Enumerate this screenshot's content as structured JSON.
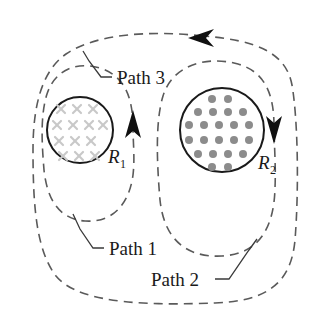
{
  "figure": {
    "background_color": "#ffffff",
    "width": 319,
    "height": 316
  },
  "colors": {
    "path_stroke": "#5a5a5a",
    "circle_stroke": "#1a1a1a",
    "cross_fill": "#c8c8c8",
    "dot_fill": "#8c8c8c",
    "text": "#1a1a1a",
    "arrow_fill": "#101010",
    "leader_stroke": "#3a3a3a"
  },
  "regions": [
    {
      "id": "R1",
      "label": "R",
      "subscript": "1",
      "marker_type": "cross",
      "marker_meaning": "field-into-page",
      "center_x": 80,
      "center_y": 130,
      "radius": 33,
      "label_x": 108,
      "label_y": 160,
      "marker_color": "#c8c8c8",
      "marker_rows": 4,
      "marker_cols": 4
    },
    {
      "id": "R2",
      "label": "R",
      "subscript": "2",
      "marker_type": "dot",
      "marker_meaning": "field-out-of-page",
      "center_x": 222,
      "center_y": 130,
      "radius": 42,
      "label_x": 258,
      "label_y": 166,
      "marker_color": "#8c8c8c",
      "marker_rows": 6,
      "marker_cols": 6,
      "marker_radius": 4
    }
  ],
  "paths": [
    {
      "id": "path1",
      "label": "Path 1",
      "encloses": [
        "R1"
      ],
      "style": "dashed",
      "label_x": 110,
      "label_y": 253,
      "leader": "M 103 248 L 92 248 L 80 230 L 72 212",
      "arrow": {
        "direction": "up",
        "x": 133,
        "y": 128,
        "points": "133,112 141,137 133,131 125,137"
      }
    },
    {
      "id": "path2",
      "label": "Path 2",
      "encloses": [
        "R2"
      ],
      "style": "dashed",
      "label_x": 152,
      "label_y": 284,
      "leader": "M 216 279 L 230 279 L 250 249 L 258 238",
      "arrow": {
        "direction": "down",
        "x": 274,
        "y": 126,
        "points": "274,142 266,117 274,123 282,117"
      }
    },
    {
      "id": "path3",
      "label": "Path 3",
      "encloses": [
        "R1",
        "R2"
      ],
      "style": "dashed",
      "label_x": 118,
      "label_y": 82,
      "leader": "M 111 76 L 100 76 L 88 62 L 82 52",
      "arrow": {
        "direction": "left",
        "x": 203,
        "y": 36,
        "points": "188,38 214,30 206,38 214,46"
      }
    }
  ],
  "labels": {
    "path1": "Path 1",
    "path2": "Path 2",
    "path3": "Path 3",
    "r1": "R",
    "r1_sub": "1",
    "r2": "R",
    "r2_sub": "2"
  }
}
